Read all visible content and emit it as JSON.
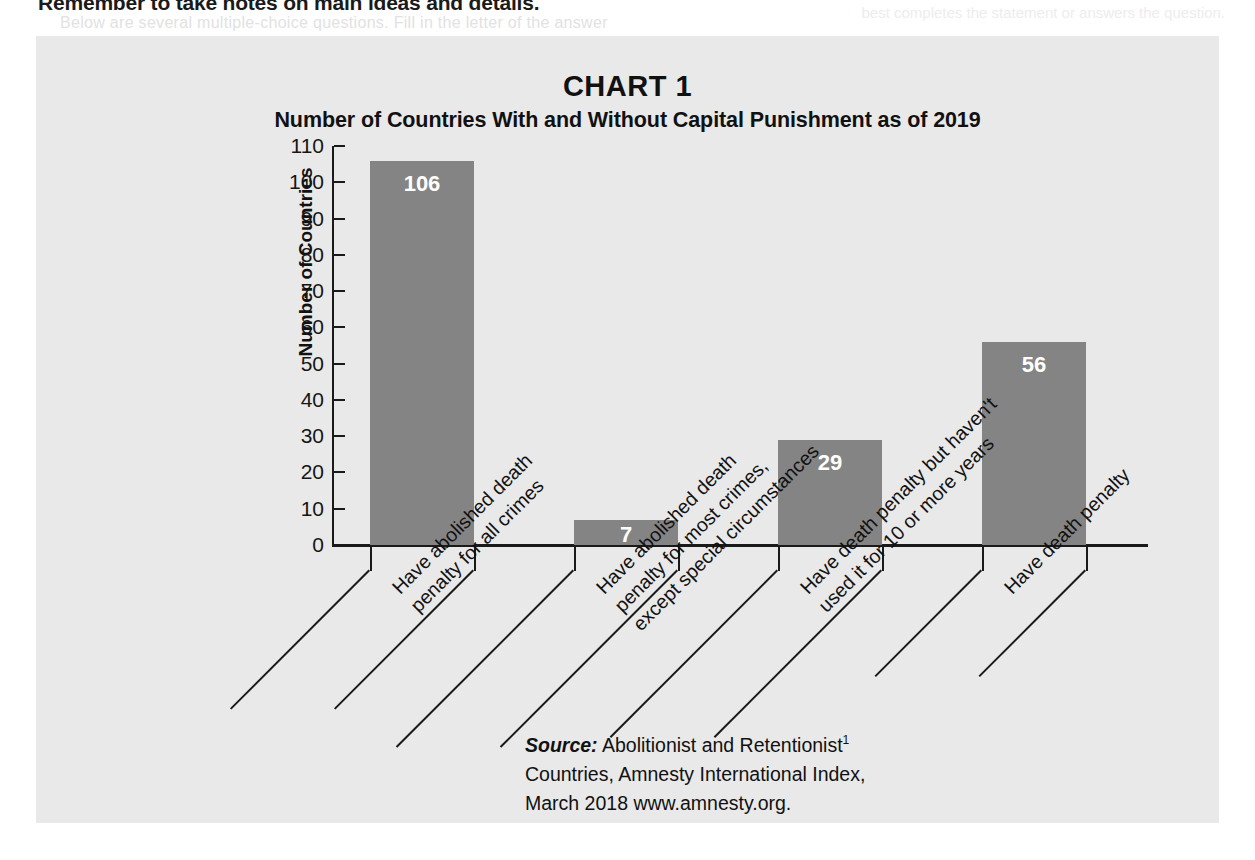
{
  "page": {
    "header_line": "Remember to take notes on main ideas and details.",
    "ghost_line": "Below are several multiple-choice questions. Fill in the letter of the answer",
    "ghost_line_right": "best completes the statement or answers the question."
  },
  "chart_data": {
    "type": "bar",
    "chart_label": "CHART 1",
    "title": "Number of Countries With and Without Capital Punishment as of 2019",
    "xlabel": "",
    "ylabel": "Number of Countries",
    "ylim": [
      0,
      110
    ],
    "ytick_step": 10,
    "yticks": [
      110,
      100,
      90,
      80,
      70,
      60,
      50,
      40,
      30,
      20,
      10,
      0
    ],
    "grid": false,
    "legend": "none",
    "bar_color": "#848484",
    "value_label_color": "#ffffff",
    "panel_background": "#e9e9e9",
    "categories": [
      "Have abolished death penalty for all crimes",
      "Have abolished death penalty for most crimes, except special circumstances",
      "Have death penalty but haven't used it for 10 or more years",
      "Have death penalty"
    ],
    "category_lines": [
      [
        "Have abolished death",
        "penalty for all crimes"
      ],
      [
        "Have abolished death",
        "penalty for most crimes,",
        "except special circumstances"
      ],
      [
        "Have death penalty but haven't",
        "used it for 10 or more years"
      ],
      [
        "Have death penalty"
      ]
    ],
    "values": [
      106,
      7,
      29,
      56
    ],
    "value_labels": [
      "106",
      "7",
      "29",
      "56"
    ]
  },
  "source": {
    "label": "Source:",
    "line1": "Abolitionist and Retentionist",
    "footnote_marker": "1",
    "line2": "Countries, Amnesty International Index,",
    "line3": "March 2018 www.amnesty.org."
  }
}
